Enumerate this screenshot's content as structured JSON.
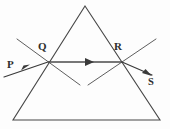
{
  "figure": {
    "background_color": "#fdfdfd",
    "ink_color": "#3a3a3a",
    "width": 170,
    "height": 129
  },
  "labels": {
    "incident_ray": "P",
    "entry_point": "Q",
    "exit_point": "R",
    "emergent_ray": "S"
  },
  "prism": {
    "name": "triangular-prism",
    "apex": {
      "x": 85,
      "y": 6
    },
    "base_left": {
      "x": 13,
      "y": 120
    },
    "base_right": {
      "x": 160,
      "y": 120
    }
  },
  "rays": {
    "incident": {
      "name": "incident-ray-P",
      "from": {
        "x": 5,
        "y": 76
      },
      "to": {
        "x": 48,
        "y": 62
      },
      "has_arrow": true
    },
    "refracted_internal": {
      "name": "refracted-ray-QR",
      "from": {
        "x": 48,
        "y": 62
      },
      "to": {
        "x": 122,
        "y": 62
      },
      "has_arrow": true,
      "arrow_at": {
        "x": 90,
        "y": 62
      }
    },
    "emergent": {
      "name": "emergent-ray-S",
      "from": {
        "x": 122,
        "y": 62
      },
      "to": {
        "x": 151,
        "y": 75
      },
      "has_arrow": true
    }
  },
  "normals": {
    "at_q": {
      "name": "normal-at-Q",
      "from": {
        "x": 17,
        "y": 39
      },
      "to": {
        "x": 80,
        "y": 85
      }
    },
    "at_r": {
      "name": "normal-at-R",
      "from": {
        "x": 88,
        "y": 85
      },
      "to": {
        "x": 156,
        "y": 39
      }
    }
  }
}
